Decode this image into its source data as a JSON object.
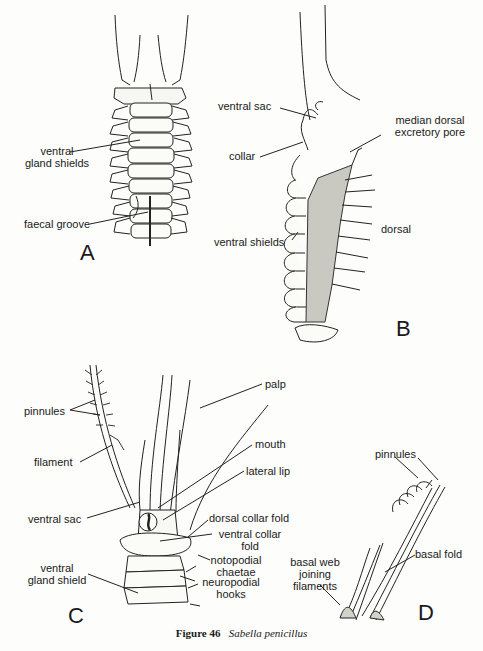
{
  "figure": {
    "number_label": "Figure 46",
    "species": "Sabella penicillus"
  },
  "panels": {
    "A": {
      "letter": "A",
      "labels": {
        "ventral_gland_shields_1": "ventral",
        "ventral_gland_shields_2": "gland shields",
        "faecal_groove": "faecal groove"
      }
    },
    "B": {
      "letter": "B",
      "labels": {
        "ventral_sac": "ventral sac",
        "collar": "collar",
        "median_dorsal_1": "median dorsal",
        "median_dorsal_2": "excretory pore",
        "dorsal": "dorsal",
        "ventral_shields": "ventral shields"
      }
    },
    "C": {
      "letter": "C",
      "labels": {
        "palp": "palp",
        "pinnules": "pinnules",
        "filament": "filament",
        "mouth": "mouth",
        "lateral_lip": "lateral lip",
        "ventral_sac": "ventral sac",
        "dorsal_collar_fold": "dorsal collar fold",
        "ventral_collar_fold_1": "ventral collar",
        "ventral_collar_fold_2": "fold",
        "notopodial_1": "notopodial",
        "notopodial_2": "chaetae",
        "ventral_gland_shield_1": "ventral",
        "ventral_gland_shield_2": "gland shield",
        "neuropodial_1": "neuropodial",
        "neuropodial_2": "hooks"
      }
    },
    "D": {
      "letter": "D",
      "labels": {
        "pinnules": "pinnules",
        "basal_fold": "basal fold",
        "basal_web_1": "basal web",
        "basal_web_2": "joining",
        "basal_web_3": "filaments"
      }
    }
  }
}
